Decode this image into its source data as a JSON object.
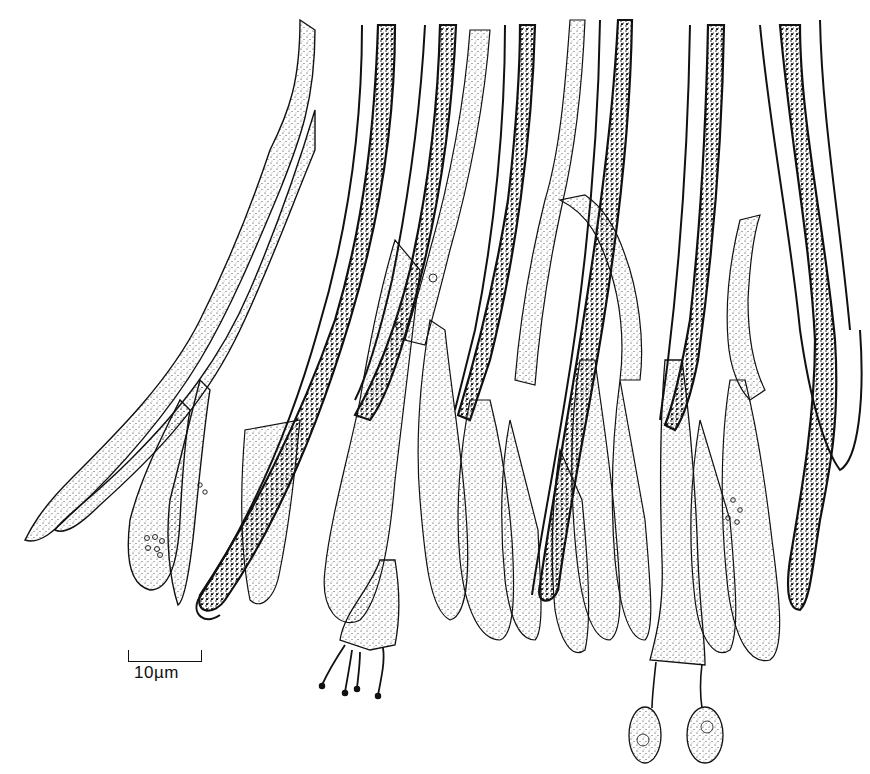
{
  "figure": {
    "ink_color": "#111111",
    "background_color": "#ffffff",
    "scale_bar": {
      "label": "10µm",
      "length_px": 72
    },
    "elements": [
      {
        "type": "hypha",
        "style": "septate, stippled",
        "count_visible": 6
      },
      {
        "type": "gloeocystidium",
        "style": "thick double wall, dense dark granular contents",
        "count_visible": 9
      },
      {
        "type": "basidium",
        "style": "clavate, 4 sterigmata",
        "location": "lower center-left"
      },
      {
        "type": "basidium",
        "style": "long stalk, 2 sterigmata with attached basidiospores",
        "location": "lower center-right"
      },
      {
        "type": "basidiospore",
        "style": "ellipsoid, stippled, with oil droplet",
        "count_visible": 2
      },
      {
        "type": "basidiole",
        "style": "clavate, stippled, with guttules",
        "count_visible": 14
      }
    ]
  }
}
